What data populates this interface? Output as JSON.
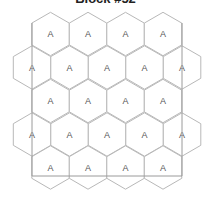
{
  "title": "Block #52",
  "colors": {
    "hex_stroke": "#b8b8b8",
    "frame_stroke": "#9a9a9a",
    "label": "#555555"
  },
  "grid": {
    "hex_radius": 21.7,
    "col_spacing": 37.5,
    "rows": [
      {
        "y": 34,
        "x": [
          50.5,
          88,
          125.5,
          163
        ],
        "labels": [
          "A",
          "A",
          "A",
          "A"
        ]
      },
      {
        "y": 67.5,
        "x": [
          32,
          69.5,
          107,
          144.5,
          182
        ],
        "labels": [
          "A",
          "A",
          "A",
          "A",
          "A"
        ]
      },
      {
        "y": 101,
        "x": [
          50.5,
          88,
          125.5,
          163
        ],
        "labels": [
          "A",
          "A",
          "A",
          "A"
        ]
      },
      {
        "y": 134.5,
        "x": [
          32,
          69.5,
          107,
          144.5,
          182
        ],
        "labels": [
          "A",
          "A",
          "A",
          "A",
          "A"
        ]
      },
      {
        "y": 167.5,
        "x": [
          50.5,
          88,
          125.5,
          163
        ],
        "labels": [
          "A",
          "A",
          "A",
          "A"
        ]
      }
    ],
    "frame": {
      "x1": 32,
      "y1": 23,
      "x2": 182,
      "y2": 176
    }
  }
}
